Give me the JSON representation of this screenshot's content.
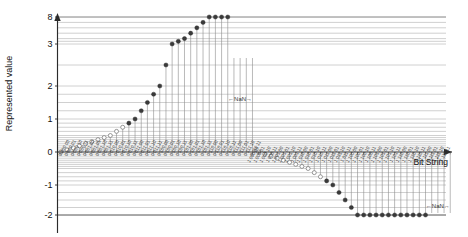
{
  "chart_data": {
    "type": "scatter",
    "title": "",
    "xlabel": "Bit String",
    "ylabel": "Represented value",
    "grid": true,
    "legend": false,
    "ylim": [
      -2.6,
      8
    ],
    "ytick_labels": [
      "8",
      "3",
      "2",
      "1",
      "0",
      "-1",
      "-2"
    ],
    "ytick_values": [
      8,
      3,
      2,
      1,
      0,
      -1,
      -2
    ],
    "ytick_pixels": [
      17,
      44,
      86,
      119,
      152,
      185,
      215
    ],
    "annotations": [
      {
        "text": "←NaN→",
        "x_index": 29,
        "y_value": 1.55
      },
      {
        "text": "←NaN→",
        "x_index": 61,
        "y_value": -1.75
      }
    ],
    "marker_styles": {
      "filled": "normal number",
      "open": "subnormal / zero"
    },
    "x_tick_labels": [
      "0 000 00",
      "0 000 01",
      "0 000 10",
      "0 000 11",
      "0 001 00",
      "0 001 01",
      "0 001 10",
      "0 001 11",
      "0 010 00",
      "0 010 01",
      "0 010 10",
      "0 010 11",
      "0 011 00",
      "0 011 01",
      "0 011 10",
      "0 011 11",
      "0 100 00",
      "0 100 01",
      "0 100 10",
      "0 100 11",
      "0 101 00",
      "0 101 01",
      "0 101 10",
      "0 101 11",
      "0 110 00",
      "0 110 01",
      "0 110 10",
      "0 110 11",
      "0 111 00",
      "0 111 01",
      "0 111 10",
      "0 111 11",
      "1 000 00",
      "1 000 01",
      "1 000 10",
      "1 000 11",
      "1 001 00",
      "1 001 01",
      "1 001 10",
      "1 001 11",
      "1 010 00",
      "1 010 01",
      "1 010 10",
      "1 010 11",
      "1 011 00",
      "1 011 01",
      "1 011 10",
      "1 011 11",
      "1 100 00",
      "1 100 01",
      "1 100 10",
      "1 100 11",
      "1 101 00",
      "1 101 01",
      "1 101 10",
      "1 101 11",
      "1 110 00",
      "1 110 01",
      "1 110 10",
      "1 110 11",
      "1 111 00",
      "1 111 01",
      "1 111 10",
      "1 111 11"
    ],
    "values": [
      0,
      0.0625,
      0.125,
      0.1875,
      0.25,
      0.3125,
      0.375,
      0.4375,
      0.5,
      0.625,
      0.75,
      0.875,
      1,
      1.25,
      1.5,
      1.75,
      2,
      2.5,
      3,
      3.5,
      4,
      5,
      6,
      7,
      8,
      10,
      12,
      14,
      null,
      null,
      null,
      null,
      0,
      -0.0625,
      -0.125,
      -0.1875,
      -0.25,
      -0.3125,
      -0.375,
      -0.4375,
      -0.5,
      -0.625,
      -0.75,
      -0.875,
      -1,
      -1.25,
      -1.5,
      -1.75,
      -2,
      -2.5,
      -3,
      -3.5,
      -4,
      -5,
      -6,
      -7,
      -8,
      -10,
      -12,
      -14,
      null,
      null,
      null,
      null
    ],
    "point_style": [
      "open",
      "open",
      "open",
      "open",
      "open",
      "open",
      "open",
      "open",
      "open",
      "open",
      "open",
      "filled",
      "filled",
      "filled",
      "filled",
      "filled",
      "filled",
      "filled",
      "filled",
      "filled",
      "filled",
      "filled",
      "filled",
      "filled",
      "filled",
      "filled",
      "filled",
      "filled",
      "nan",
      "nan",
      "nan",
      "nan",
      "open",
      "open",
      "open",
      "open",
      "open",
      "open",
      "open",
      "open",
      "open",
      "open",
      "open",
      "filled",
      "filled",
      "filled",
      "filled",
      "filled",
      "filled",
      "filled",
      "filled",
      "filled",
      "filled",
      "filled",
      "filled",
      "filled",
      "filled",
      "filled",
      "filled",
      "filled",
      "nan",
      "nan",
      "nan",
      "nan"
    ]
  }
}
